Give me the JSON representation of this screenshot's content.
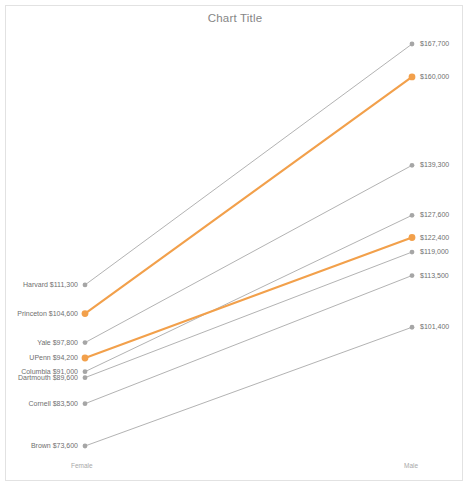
{
  "chart": {
    "title": "Chart Title",
    "axis": {
      "left_category": "Female",
      "right_category": "Male"
    },
    "colors": {
      "accent": "#F2A04B",
      "muted": "#A6A6A6",
      "text": "#6F6F6F",
      "title": "#868686",
      "border": "#E2E2E2"
    }
  },
  "chart_data": {
    "type": "line",
    "subtype": "slope",
    "title": "Chart Title",
    "xlabel": "",
    "ylabel": "",
    "categories": [
      "Female",
      "Male"
    ],
    "tick_labels": [
      "Female",
      "Male"
    ],
    "grid": false,
    "legend": "none",
    "ylim": [
      70000,
      172000
    ],
    "value_prefix": "$",
    "series": [
      {
        "name": "Harvard",
        "values": [
          111300,
          167700
        ],
        "highlight": false,
        "color": "#A6A6A6",
        "left_label": "Harvard  $111,300",
        "right_label": "$167,700"
      },
      {
        "name": "Princeton",
        "values": [
          104600,
          160000
        ],
        "highlight": true,
        "color": "#F2A04B",
        "left_label": "Princeton  $104,600",
        "right_label": "$160,000"
      },
      {
        "name": "Yale",
        "values": [
          97800,
          139300
        ],
        "highlight": false,
        "color": "#A6A6A6",
        "left_label": "Yale  $97,800",
        "right_label": "$139,300"
      },
      {
        "name": "Columbia",
        "values": [
          91000,
          127600
        ],
        "highlight": false,
        "color": "#A6A6A6",
        "left_label": "Columbia  $91,000",
        "right_label": "$127,600"
      },
      {
        "name": "UPenn",
        "values": [
          94200,
          122400
        ],
        "highlight": true,
        "color": "#F2A04B",
        "left_label": "UPenn  $94,200",
        "right_label": "$122,400"
      },
      {
        "name": "Dartmouth",
        "values": [
          89600,
          119000
        ],
        "highlight": false,
        "color": "#A6A6A6",
        "left_label": "Dartmouth  $89,600",
        "right_label": "$119,000"
      },
      {
        "name": "Cornell",
        "values": [
          83500,
          113500
        ],
        "highlight": false,
        "color": "#A6A6A6",
        "left_label": "Cornell  $83,500",
        "right_label": "$113,500"
      },
      {
        "name": "Brown",
        "values": [
          73600,
          101400
        ],
        "highlight": false,
        "color": "#A6A6A6",
        "left_label": "Brown  $73,600",
        "right_label": "$101,400"
      }
    ]
  }
}
